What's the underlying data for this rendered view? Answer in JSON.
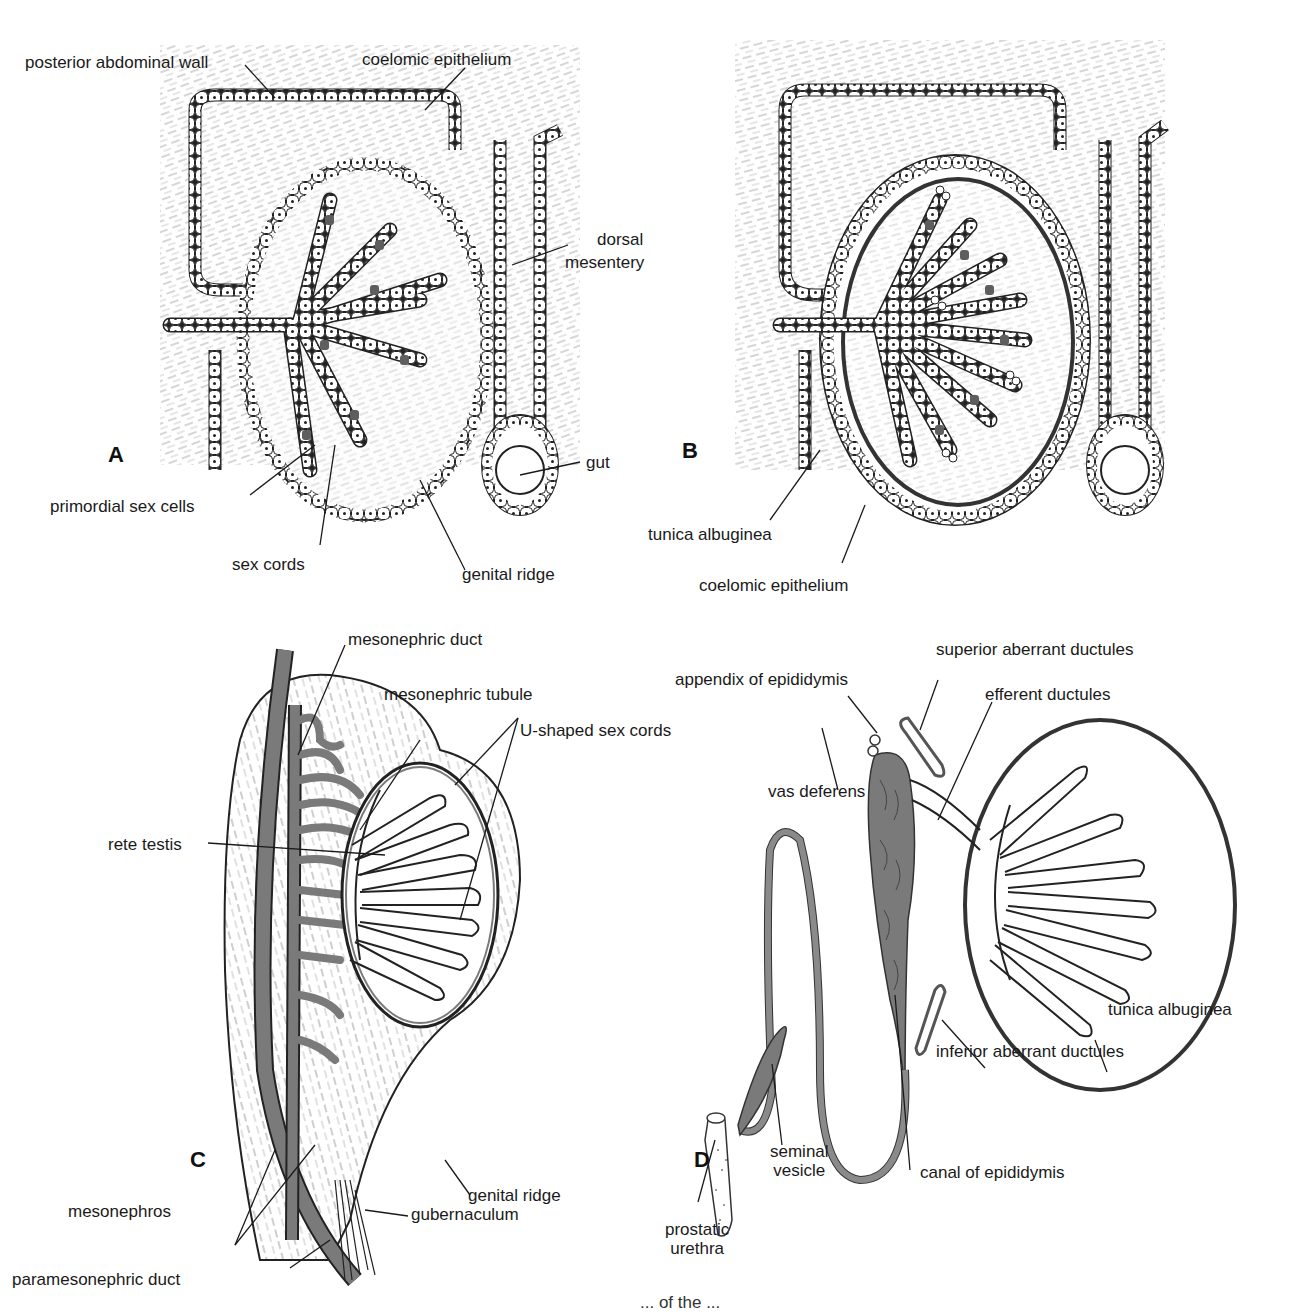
{
  "figure": {
    "panels": [
      {
        "id": "A",
        "letter": "A",
        "labels": {
          "posterior_abdominal_wall": "posterior abdominal wall",
          "coelomic_epithelium": "coelomic epithelium",
          "dorsal_mesentery": "dorsal\nmesentery",
          "dorsal_mesentery_line1": "dorsal",
          "dorsal_mesentery_line2": "mesentery",
          "gut": "gut",
          "primordial_sex_cells": "primordial sex cells",
          "sex_cords": "sex cords",
          "genital_ridge": "genital ridge"
        }
      },
      {
        "id": "B",
        "letter": "B",
        "labels": {
          "tunica_albuginea": "tunica albuginea",
          "coelomic_epithelium": "coelomic epithelium"
        }
      },
      {
        "id": "C",
        "letter": "C",
        "labels": {
          "mesonephric_duct": "mesonephric duct",
          "mesonephric_tubule": "mesonephric tubule",
          "u_shaped_sex_cords": "U-shaped sex cords",
          "rete_testis": "rete testis",
          "mesonephros": "mesonephros",
          "genital_ridge": "genital ridge",
          "gubernaculum": "gubernaculum",
          "paramesonephric_duct": "paramesonephric duct"
        }
      },
      {
        "id": "D",
        "letter": "D",
        "labels": {
          "superior_aberrant_ductules": "superior aberrant ductules",
          "appendix_of_epididymis": "appendix of epididymis",
          "efferent_ductules": "efferent ductules",
          "vas_deferens": "vas deferens",
          "tunica_albuginea": "tunica albuginea",
          "inferior_aberrant_ductules": "inferior aberrant ductules",
          "seminal_vesicle_line1": "seminal",
          "seminal_vesicle_line2": "vesicle",
          "canal_of_epididymis": "canal of epididymis",
          "prostatic_urethra_line1": "prostatic",
          "prostatic_urethra_line2": "urethra"
        }
      }
    ],
    "colors": {
      "ink": "#1a1a1a",
      "duct_gray": "#7a7a7a",
      "cell_fill": "#ffffff",
      "primordial_cell": "#5e5e5e"
    },
    "caption_partial": "... of the ..."
  }
}
